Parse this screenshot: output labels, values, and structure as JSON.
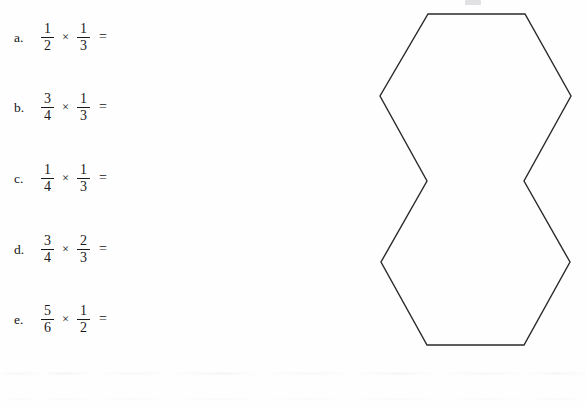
{
  "page": {
    "background_color": "#fefefe",
    "ink_color": "#1a1a1a",
    "width": 586,
    "height": 407
  },
  "worksheet": {
    "problems": [
      {
        "label": "a.",
        "left_numerator": "1",
        "left_denominator": "2",
        "operator": "×",
        "right_numerator": "1",
        "right_denominator": "3",
        "equals": "=",
        "answer": ""
      },
      {
        "label": "b.",
        "left_numerator": "3",
        "left_denominator": "4",
        "operator": "×",
        "right_numerator": "1",
        "right_denominator": "3",
        "equals": "=",
        "answer": ""
      },
      {
        "label": "c.",
        "left_numerator": "1",
        "left_denominator": "4",
        "operator": "×",
        "right_numerator": "1",
        "right_denominator": "3",
        "equals": "=",
        "answer": ""
      },
      {
        "label": "d.",
        "left_numerator": "3",
        "left_denominator": "4",
        "operator": "×",
        "right_numerator": "2",
        "right_denominator": "3",
        "equals": "=",
        "answer": ""
      },
      {
        "label": "e.",
        "left_numerator": "5",
        "left_denominator": "6",
        "operator": "×",
        "right_numerator": "1",
        "right_denominator": "2",
        "equals": "=",
        "answer": ""
      }
    ]
  },
  "figure": {
    "name": "double-hexagon-outline",
    "stroke_color": "#2a2a2a",
    "fill_color": "none",
    "stroke_width": 1.4,
    "vertices": [
      [
        68,
        14
      ],
      [
        165,
        14
      ],
      [
        211,
        96
      ],
      [
        164,
        181
      ],
      [
        210,
        262
      ],
      [
        164,
        345
      ],
      [
        67,
        345
      ],
      [
        21,
        262
      ],
      [
        67,
        181
      ],
      [
        20,
        96
      ]
    ]
  }
}
